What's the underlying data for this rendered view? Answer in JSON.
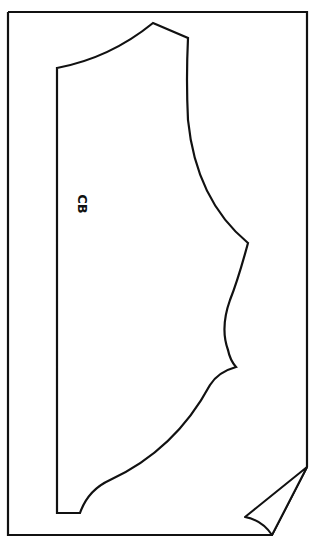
{
  "diagram": {
    "type": "sewing-pattern-piece",
    "piece": "bodice-back",
    "labels": {
      "center_back": "CB"
    },
    "colors": {
      "stroke": "#111111",
      "background": "#ffffff"
    }
  }
}
